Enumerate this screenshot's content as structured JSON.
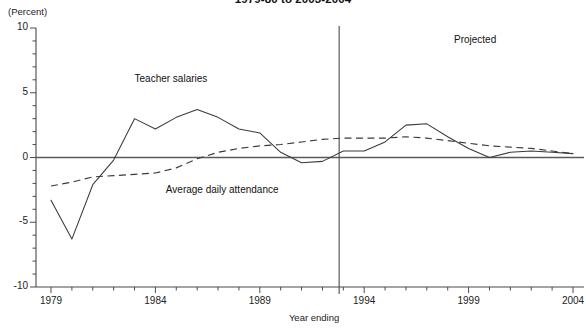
{
  "chart_data": {
    "type": "line",
    "title": "1979-80 to 2003-2004",
    "unit_label": "(Percent)",
    "xlabel": "Year ending",
    "ylabel": "",
    "xlim": [
      1979,
      2004
    ],
    "ylim": [
      -10,
      10
    ],
    "grid": false,
    "legend_position": "inline-annotations",
    "ytick_labels": [
      "10",
      "5",
      "0",
      "-5",
      "-10"
    ],
    "ytick_values": [
      10,
      5,
      0,
      -5,
      -10
    ],
    "yminor_step": 1,
    "xtick_labels": [
      "1979",
      "1984",
      "1989",
      "1994",
      "1999",
      "2004"
    ],
    "xtick_values": [
      1979,
      1984,
      1989,
      1994,
      1999,
      2004
    ],
    "xminor_step": 1,
    "annotations": [
      {
        "text": "Projected",
        "x": 1998.3,
        "y": 9.0
      }
    ],
    "divider": {
      "label": "Projected boundary",
      "x": 1992.8
    },
    "x": [
      1979,
      1980,
      1981,
      1982,
      1983,
      1984,
      1985,
      1986,
      1987,
      1988,
      1989,
      1990,
      1991,
      1992,
      1993,
      1994,
      1995,
      1996,
      1997,
      1998,
      1999,
      2000,
      2001,
      2002,
      2003,
      2004
    ],
    "series": [
      {
        "name": "Teacher salaries",
        "style": "solid",
        "label_x": 1983.0,
        "label_y": 6.0,
        "values": [
          -3.3,
          -6.3,
          -2.1,
          -0.2,
          3.0,
          2.2,
          3.1,
          3.7,
          3.1,
          2.2,
          1.9,
          0.4,
          -0.4,
          -0.3,
          0.5,
          0.5,
          1.2,
          2.5,
          2.6,
          1.6,
          0.7,
          0.0,
          0.4,
          0.5,
          0.4,
          0.3
        ]
      },
      {
        "name": "Average daily attendance",
        "style": "dashed",
        "label_x": 1984.5,
        "label_y": -2.6,
        "values": [
          -2.2,
          -1.9,
          -1.5,
          -1.4,
          -1.3,
          -1.2,
          -0.8,
          -0.1,
          0.4,
          0.7,
          0.9,
          1.0,
          1.2,
          1.4,
          1.5,
          1.5,
          1.5,
          1.6,
          1.5,
          1.3,
          1.1,
          0.9,
          0.8,
          0.7,
          0.5,
          0.3
        ]
      }
    ]
  }
}
